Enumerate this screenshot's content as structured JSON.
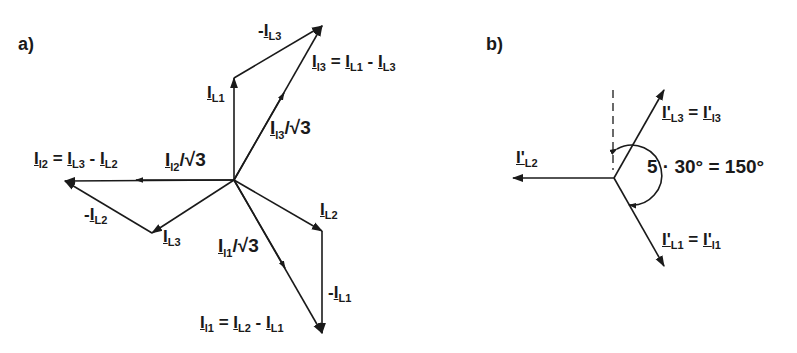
{
  "panels": [
    {
      "id": "a",
      "label": "a)",
      "vectors": [
        {
          "name": "I_L1",
          "label": "I_L1"
        },
        {
          "name": "I_L2",
          "label": "I_L2"
        },
        {
          "name": "I_L3",
          "label": "I_L3"
        },
        {
          "name": "minus_I_L1",
          "label": "-I_L1"
        },
        {
          "name": "minus_I_L2",
          "label": "-I_L2"
        },
        {
          "name": "minus_I_L3",
          "label": "-I_L3"
        },
        {
          "name": "I_l1_over_sqrt3",
          "label": "I_l1/√3"
        },
        {
          "name": "I_l2_over_sqrt3",
          "label": "I_l2/√3"
        },
        {
          "name": "I_l3_over_sqrt3",
          "label": "I_l3/√3"
        }
      ],
      "equations": {
        "l1": "I_l1 = I_L2 - I_L1",
        "l2": "I_l2 = I_L3 - I_L2",
        "l3": "I_l3 = I_L1 - I_L3"
      }
    },
    {
      "id": "b",
      "label": "b)",
      "vectors": [
        {
          "name": "I'_L2",
          "label": "I'_L2"
        },
        {
          "name": "I'_L3",
          "label": "I'_L3 = I'_l3"
        },
        {
          "name": "I'_L1",
          "label": "I'_L1 = I'_l1"
        }
      ],
      "angle_label": "5 · 30° = 150°"
    }
  ],
  "text": {
    "a_label": "a)",
    "b_label": "b)",
    "minus": "-",
    "eq": " = ",
    "sub_L1": "L1",
    "sub_L2": "L2",
    "sub_L3": "L3",
    "sub_l1": "l1",
    "sub_l2": "l2",
    "sub_l3": "l3",
    "I": "I",
    "Ip": "I'",
    "over_sqrt3": "/√3",
    "angle": "5 · 30° = 150°"
  }
}
